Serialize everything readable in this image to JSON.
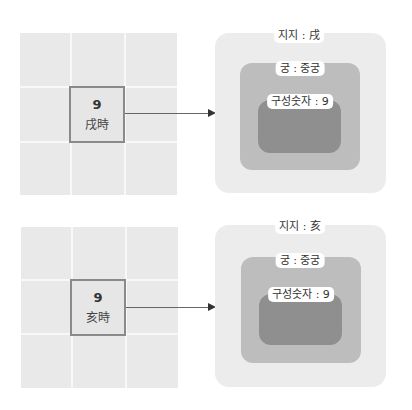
{
  "panels": [
    {
      "grid": {
        "number": "9",
        "label": "戌時"
      },
      "nested": {
        "outer_label": "지지 : 戌",
        "middle_label": "궁 : 중궁",
        "inner_label": "구성숫자 : 9"
      }
    },
    {
      "grid": {
        "number": "9",
        "label": "亥時"
      },
      "nested": {
        "outer_label": "지지 : 亥",
        "middle_label": "궁 : 중궁",
        "inner_label": "구성숫자 : 9"
      }
    }
  ],
  "colors": {
    "grid_bg": "#e9e9e9",
    "highlight_border": "#8a8a8a",
    "outer": "#ececec",
    "middle": "#bdbdbd",
    "inner": "#8f8f8f"
  }
}
